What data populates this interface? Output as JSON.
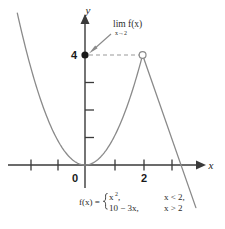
{
  "figure": {
    "name": "piecewise-limit-graph",
    "width": 225,
    "height": 229,
    "background_color": "#ffffff"
  },
  "axes": {
    "x_axis_label": "x",
    "y_axis_label": "y",
    "origin_label": "0",
    "x_tick_label": "2",
    "y_tick_label": "4",
    "axis_color": "#3a3a3a",
    "x_ticks_visible": [
      -2,
      -1,
      1,
      2,
      3
    ],
    "y_ticks_visible": [
      1,
      2,
      3,
      4
    ]
  },
  "annotation": {
    "limit_expression": "lim f(x)",
    "limit_subscript": "x→2",
    "arrow_color": "#8a8a8a",
    "dashed_line_color": "#9a9a9a",
    "closed_point_label": "4",
    "closed_point_color": "#1a1a1a",
    "open_point_color": "#ffffff"
  },
  "formula": {
    "lhs": "f(x) =",
    "piece_1_expr": "x",
    "piece_1_exponent": "2",
    "piece_1_comma": ",",
    "piece_1_condition": "x < 2,",
    "piece_2_expr": "10 − 3x,",
    "piece_2_condition": "x > 2"
  },
  "chart_data": {
    "type": "line",
    "title": "",
    "xlabel": "x",
    "ylabel": "y",
    "xlim": [
      -2.4,
      3.9
    ],
    "ylim": [
      -1.1,
      4.6
    ],
    "grid": false,
    "legend": "none",
    "curve_color": "#8a8a8a",
    "series": [
      {
        "name": "x^2 for x < 2",
        "type": "parabola",
        "expression": "y = x^2",
        "domain": [
          -2.35,
          2.0
        ],
        "points": [
          {
            "x": -2.35,
            "y": 5.52
          },
          {
            "x": -2.0,
            "y": 4.0
          },
          {
            "x": -1.5,
            "y": 2.25
          },
          {
            "x": -1.0,
            "y": 1.0
          },
          {
            "x": -0.5,
            "y": 0.25
          },
          {
            "x": 0.0,
            "y": 0.0
          },
          {
            "x": 0.5,
            "y": 0.25
          },
          {
            "x": 1.0,
            "y": 1.0
          },
          {
            "x": 1.5,
            "y": 2.25
          },
          {
            "x": 2.0,
            "y": 4.0
          }
        ]
      },
      {
        "name": "10 - 3x for x > 2",
        "type": "line",
        "expression": "y = 10 - 3x",
        "domain": [
          2.0,
          3.85
        ],
        "points": [
          {
            "x": 2.0,
            "y": 4.0
          },
          {
            "x": 2.5,
            "y": 2.5
          },
          {
            "x": 3.0,
            "y": 1.0
          },
          {
            "x": 3.33,
            "y": 0.0
          },
          {
            "x": 3.85,
            "y": -1.55
          }
        ]
      }
    ],
    "markers": [
      {
        "kind": "closed-circle",
        "x": 0,
        "y": 4,
        "label": "4",
        "note": "limit value on y-axis"
      },
      {
        "kind": "open-circle",
        "x": 2,
        "y": 4,
        "label": "",
        "note": "function undefined at x = 2"
      }
    ],
    "annotations": [
      {
        "text": "lim f(x)",
        "subtext": "x→2",
        "points_to": {
          "x": 0,
          "y": 4
        }
      }
    ]
  }
}
